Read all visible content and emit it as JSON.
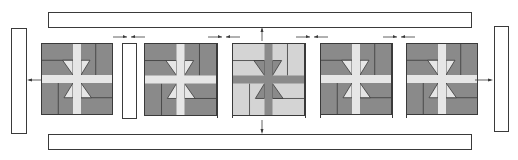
{
  "diagram": {
    "type": "quilt-assembly",
    "colors": {
      "dark": "#8a8a8a",
      "medium": "#a9a9a9",
      "light": "#d4d4d4",
      "lighter": "#e6e6e6",
      "outline": "#3a3a3a",
      "strip": "#ffffff"
    },
    "borders": {
      "top": {
        "x": 48,
        "y": 12,
        "w": 423,
        "h": 15
      },
      "bottom": {
        "x": 48,
        "y": 134,
        "w": 423,
        "h": 15
      },
      "left": {
        "x": 11,
        "y": 28,
        "w": 15,
        "h": 105
      },
      "right": {
        "x": 494,
        "y": 26,
        "w": 14,
        "h": 105
      }
    },
    "blocks": [
      {
        "id": "block-1",
        "x": 41,
        "y": 43,
        "size": 72,
        "shade": "dark"
      },
      {
        "id": "block-2",
        "x": 144,
        "y": 43,
        "size": 73,
        "shade": "dark"
      },
      {
        "id": "block-3",
        "x": 232,
        "y": 43,
        "size": 73,
        "shade": "light"
      },
      {
        "id": "block-4",
        "x": 320,
        "y": 43,
        "size": 72,
        "shade": "dark"
      },
      {
        "id": "block-5",
        "x": 406,
        "y": 43,
        "size": 72,
        "shade": "dark"
      }
    ],
    "sashing": [
      {
        "id": "sashing-1",
        "x": 122,
        "y": 43,
        "w": 14,
        "h": 75,
        "outlined": true
      },
      {
        "id": "sashing-2",
        "x": 217,
        "y": 43,
        "w": 15,
        "h": 75,
        "outlined": false
      },
      {
        "id": "sashing-3",
        "x": 305,
        "y": 43,
        "w": 15,
        "h": 75,
        "outlined": false
      },
      {
        "id": "sashing-4",
        "x": 392,
        "y": 43,
        "w": 14,
        "h": 75,
        "outlined": false
      }
    ],
    "arrows": [
      {
        "id": "join-arrow-1",
        "x": 129,
        "y": 37,
        "dir": "converge"
      },
      {
        "id": "join-arrow-2",
        "x": 224,
        "y": 37,
        "dir": "converge"
      },
      {
        "id": "join-arrow-3",
        "x": 312,
        "y": 37,
        "dir": "converge"
      },
      {
        "id": "join-arrow-4",
        "x": 399,
        "y": 37,
        "dir": "converge"
      },
      {
        "id": "top-border-arrow",
        "x": 262,
        "y": 33,
        "dir": "up"
      },
      {
        "id": "bottom-border-arrow",
        "x": 262,
        "y": 128,
        "dir": "down"
      },
      {
        "id": "left-border-arrow",
        "x": 33,
        "y": 80,
        "dir": "left"
      },
      {
        "id": "right-border-arrow",
        "x": 487,
        "y": 80,
        "dir": "right"
      }
    ]
  }
}
